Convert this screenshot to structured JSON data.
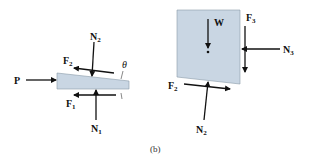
{
  "figure": {
    "caption": "(b)",
    "colors": {
      "body_fill": "#c9d6e3",
      "body_stroke": "#8a9aa8",
      "arrow": "#111111"
    },
    "wedge_fbd": {
      "labels": {
        "P": "P",
        "N2_base": "N",
        "N2_sub": "2",
        "F2_base": "F",
        "F2_sub": "2",
        "F1_base": "F",
        "F1_sub": "1",
        "N1_base": "N",
        "N1_sub": "1",
        "theta": "θ"
      }
    },
    "block_fbd": {
      "labels": {
        "W": "W",
        "F3_base": "F",
        "F3_sub": "3",
        "N3_base": "N",
        "N3_sub": "3",
        "F2_base": "F",
        "F2_sub": "2",
        "N2_base": "N",
        "N2_sub": "2"
      }
    }
  }
}
